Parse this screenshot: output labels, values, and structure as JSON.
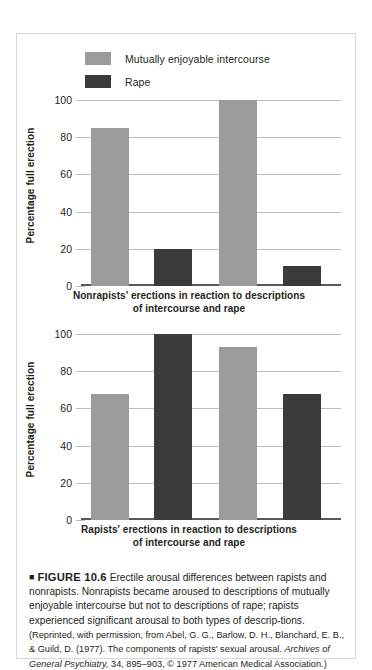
{
  "figure": {
    "marker": "■",
    "number": "FIGURE 10.6",
    "body": "Erectile arousal differences between rapists and nonrapists. Nonrapists became aroused to descriptions of mutually enjoyable intercourse but not to descriptions of rape; rapists experienced significant arousal to both types of descrip-tions.",
    "source_pre": "(Reprinted, with permission, from Abel, G. G., Barlow, D. H., Blanchard, E. B., & Guild, D. (1977). The components of rapists' sexual arousal. ",
    "source_journal": "Archives of General Psychiatry,",
    "source_post": " 34, 895–903, © 1977 American Medical Association.)"
  },
  "legend": {
    "items": [
      {
        "label": "Mutually enjoyable intercourse",
        "color": "#9b9b9b",
        "key": "mutually-enjoyable-intercourse"
      },
      {
        "label": "Rape",
        "color": "#3b3b3b",
        "key": "rape"
      }
    ]
  },
  "chart_data": [
    {
      "id": "nonrapists",
      "type": "bar",
      "title": "",
      "xlabel": "Nonrapists' erections in reaction to descriptions of intercourse and rape",
      "ylabel": "Percentage full erection",
      "ylim": [
        0,
        100
      ],
      "yticks": [
        0,
        20,
        40,
        60,
        80,
        100
      ],
      "ytick_labels": [
        "0",
        "20",
        "40",
        "60",
        "80",
        "100"
      ],
      "grid": true,
      "legend_position": "top-left",
      "categories": [
        "1",
        "2",
        "3",
        "4"
      ],
      "bars": [
        {
          "series": "Mutually enjoyable intercourse",
          "value": 85,
          "color": "#9b9b9b"
        },
        {
          "series": "Rape",
          "value": 20,
          "color": "#3b3b3b"
        },
        {
          "series": "Mutually enjoyable intercourse",
          "value": 100,
          "color": "#9b9b9b"
        },
        {
          "series": "Rape",
          "value": 11,
          "color": "#3b3b3b"
        }
      ]
    },
    {
      "id": "rapists",
      "type": "bar",
      "title": "",
      "xlabel": "Rapists' erections in reaction to descriptions of intercourse and rape",
      "ylabel": "Percentage full erection",
      "ylim": [
        0,
        100
      ],
      "yticks": [
        0,
        20,
        40,
        60,
        80,
        100
      ],
      "ytick_labels": [
        "0",
        "20",
        "40",
        "60",
        "80",
        "100"
      ],
      "grid": true,
      "legend_position": "none",
      "categories": [
        "1",
        "2",
        "3",
        "4"
      ],
      "bars": [
        {
          "series": "Mutually enjoyable intercourse",
          "value": 68,
          "color": "#9b9b9b"
        },
        {
          "series": "Rape",
          "value": 100,
          "color": "#3b3b3b"
        },
        {
          "series": "Mutually enjoyable intercourse",
          "value": 93,
          "color": "#9b9b9b"
        },
        {
          "series": "Rape",
          "value": 68,
          "color": "#3b3b3b"
        }
      ]
    }
  ],
  "chart_labels": {
    "top_xlabel_line1": "Nonrapists' erections in reaction to descriptions",
    "top_xlabel_line2": "of intercourse and rape",
    "bottom_xlabel_line1": "Rapists' erections in reaction to descriptions",
    "bottom_xlabel_line2": "of intercourse and rape",
    "ylabel": "Percentage full erection"
  }
}
